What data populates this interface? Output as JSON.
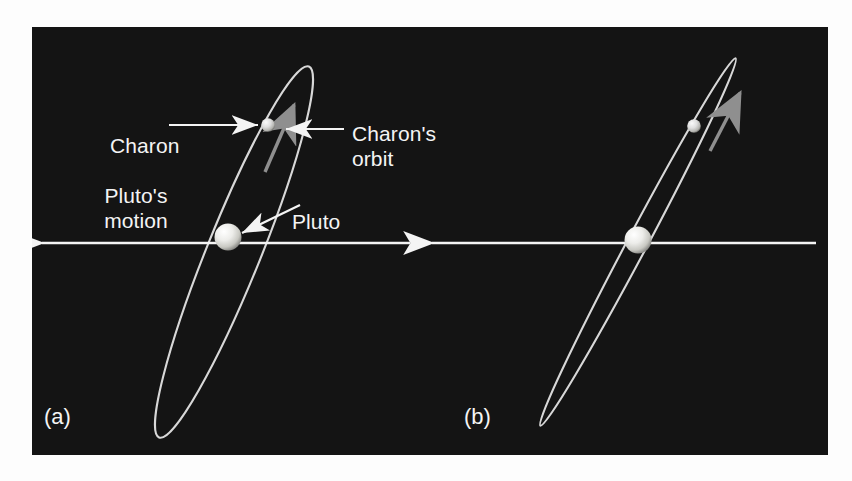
{
  "figure": {
    "background_color": "#141414",
    "page_color": "#fdfdfd",
    "text_color": "#f4f4f4",
    "orbit_color": "#d8d8d8",
    "arrow_color": "#f4f4f4",
    "direction_arrow_color": "#8f8f8f",
    "pluto_color": "#e8e8e0",
    "charon_color": "#d6d6d0"
  },
  "panels": [
    {
      "tag": "(a)",
      "labels": {
        "charon": "Charon",
        "charon_orbit_line1": "Charon's",
        "charon_orbit_line2": "orbit",
        "plutos_motion_line1": "Pluto's",
        "plutos_motion_line2": "motion",
        "pluto": "Pluto"
      },
      "bodies": {
        "pluto": {
          "name": "Pluto",
          "radius": 13
        },
        "charon": {
          "name": "Charon",
          "radius": 6.5
        }
      },
      "orbit": {
        "description": "Charon's orbit seen obliquely - wide tilted ellipse",
        "semi_major": 200,
        "semi_minor": 26,
        "tilt_degrees": -68
      },
      "motion_arrow": {
        "direction": "left",
        "label": "Pluto's motion"
      }
    },
    {
      "tag": "(b)",
      "labels": {},
      "bodies": {
        "pluto": {
          "name": "Pluto",
          "radius": 13
        },
        "charon": {
          "name": "Charon",
          "radius": 6.5
        }
      },
      "orbit": {
        "description": "Charon's orbit seen nearly edge-on - narrow ellipse",
        "semi_major": 208,
        "semi_minor": 9,
        "tilt_degrees": -62
      },
      "motion_arrow": {
        "direction": "left",
        "label": "Pluto's motion"
      }
    }
  ]
}
